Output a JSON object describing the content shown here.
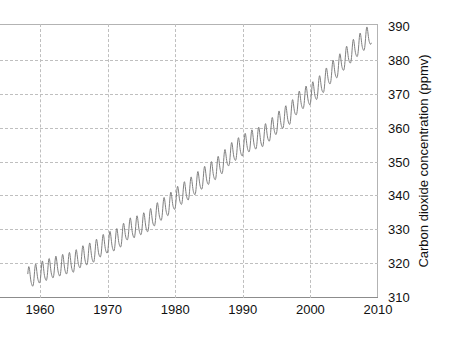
{
  "chart_data": {
    "type": "line",
    "title": "",
    "subtitle": "",
    "xlabel": "",
    "ylabel": "Carbon dioxide concentration (ppmv)",
    "xlim": [
      1957.0,
      2010.0
    ],
    "ylim": [
      310,
      390
    ],
    "xticks": [
      1960,
      1970,
      1980,
      1990,
      2000,
      2010
    ],
    "xtick_labels": [
      "1960",
      "1970",
      "1980",
      "1990",
      "2000",
      "2010"
    ],
    "yticks": [
      310,
      320,
      330,
      340,
      350,
      360,
      370,
      380,
      390
    ],
    "ytick_labels": [
      "310",
      "320",
      "330",
      "340",
      "350",
      "360",
      "370",
      "380",
      "390"
    ],
    "grid": "dashed gray gridlines on both axes",
    "legend": "none",
    "series": [
      {
        "name": "Atmospheric CO2 (Mauna Loa, monthly mean)",
        "color": "#808080",
        "line_width": 1,
        "seasonal_amplitude_ppmv": 3.0,
        "seasonal_peak_month": "May",
        "seasonal_min_month": "September",
        "annual_mean_x": [
          1958,
          1959,
          1960,
          1961,
          1962,
          1963,
          1964,
          1965,
          1966,
          1967,
          1968,
          1969,
          1970,
          1971,
          1972,
          1973,
          1974,
          1975,
          1976,
          1977,
          1978,
          1979,
          1980,
          1981,
          1982,
          1983,
          1984,
          1985,
          1986,
          1987,
          1988,
          1989,
          1990,
          1991,
          1992,
          1993,
          1994,
          1995,
          1996,
          1997,
          1998,
          1999,
          2000,
          2001,
          2002,
          2003,
          2004,
          2005,
          2006,
          2007,
          2008,
          2009
        ],
        "annual_mean_y": [
          315.3,
          315.9,
          316.9,
          317.6,
          318.4,
          318.9,
          319.5,
          320.0,
          321.4,
          322.2,
          323.0,
          324.6,
          325.7,
          326.3,
          327.5,
          329.7,
          330.2,
          331.1,
          332.0,
          333.8,
          335.4,
          336.8,
          338.7,
          340.1,
          341.4,
          343.0,
          344.6,
          346.0,
          347.4,
          349.2,
          351.6,
          353.1,
          354.4,
          355.6,
          356.4,
          357.1,
          358.8,
          360.8,
          362.6,
          363.7,
          366.7,
          368.4,
          369.5,
          371.1,
          373.2,
          375.8,
          377.5,
          379.8,
          381.9,
          383.8,
          385.6,
          387.4
        ]
      }
    ],
    "annotations": []
  },
  "axis": {
    "x_tick_labels": [
      "1960",
      "1970",
      "1980",
      "1990",
      "2000",
      "2010"
    ],
    "y_tick_labels": [
      "390",
      "380",
      "370",
      "360",
      "350",
      "340",
      "330",
      "320",
      "310"
    ],
    "y_title": "Carbon dioxide concentration (ppmv)"
  },
  "colors": {
    "curve": "#808080",
    "grid": "#bfbfbf",
    "frame": "#b3b3b3",
    "axis": "#8c8c8c",
    "text": "#111111",
    "background": "#ffffff"
  }
}
